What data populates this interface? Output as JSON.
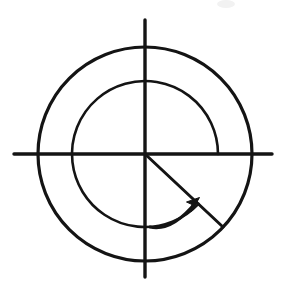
{
  "figure": {
    "kind": "math-diagram",
    "title": "Concentric circles with axes and negative swept angle",
    "background_color": "#ffffff",
    "ink_color": "#141414"
  },
  "chart_data": {
    "type": "scatter",
    "title": "",
    "subtitle": "",
    "xlabel": "",
    "ylabel": "",
    "grid": false,
    "legend": false,
    "axis_ranges": {
      "x": [
        -1.45,
        1.2
      ],
      "y": [
        -1.15,
        1.27
      ]
    },
    "center": {
      "x": 145,
      "y": 154
    },
    "circles": [
      {
        "name": "outer-circle",
        "radius_px": 107,
        "radius_units": 1.0,
        "complete": true
      },
      {
        "name": "inner-circle",
        "radius_px": 73,
        "radius_units": 0.682,
        "complete": false,
        "gap_from_deg": -43,
        "gap_to_deg": 0
      }
    ],
    "axes": [
      {
        "name": "x-axis",
        "from_px": {
          "x": 14,
          "y": 154
        },
        "to_px": {
          "x": 272,
          "y": 154
        }
      },
      {
        "name": "y-axis",
        "from_px": {
          "x": 145,
          "y": 20
        },
        "to_px": {
          "x": 145,
          "y": 277
        }
      }
    ],
    "radius_vector": {
      "name": "terminal-side",
      "angle_deg": -43,
      "from_px": {
        "x": 145,
        "y": 154
      },
      "to_px": {
        "x": 223,
        "y": 227
      },
      "length_px": 107
    },
    "swept_angle": {
      "name": "negative-angle-arc",
      "start_deg": 0,
      "end_deg": -317,
      "direction": "clockwise",
      "sweep_sign": "negative",
      "arrow_at": "end",
      "arc_radius_px": 73
    },
    "annotations": [],
    "values": [],
    "x": []
  },
  "elements": {
    "outer_circle_label": "outer circle",
    "inner_arc_label": "inner arc",
    "x_axis_label": "horizontal axis",
    "y_axis_label": "vertical axis",
    "radius_label": "terminal side ray",
    "angle_arc_label": "swept angle arc",
    "arrow_label": "direction arrowhead"
  }
}
